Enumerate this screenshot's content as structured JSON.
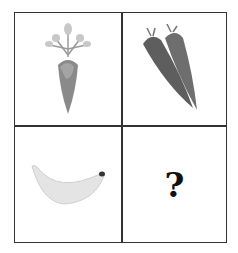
{
  "puzzle": {
    "cells": [
      {
        "position": "top-left",
        "content": "single carrot with leaves",
        "icon": "carrot-icon"
      },
      {
        "position": "top-right",
        "content": "two carrots",
        "icon": "two-carrots-icon"
      },
      {
        "position": "bottom-left",
        "content": "banana",
        "icon": "banana-icon"
      },
      {
        "position": "bottom-right",
        "content": "?",
        "icon": "question-mark"
      }
    ],
    "question_mark": "?"
  }
}
